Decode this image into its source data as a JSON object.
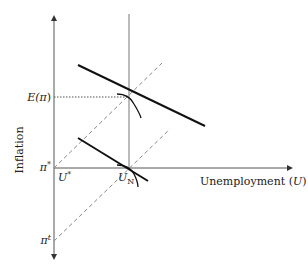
{
  "diagram": {
    "type": "phillips-curve-diagram",
    "axes": {
      "y_label": "Inflation",
      "x_label_text": "Unemployment (",
      "x_label_var": "U",
      "x_label_close": ")"
    },
    "labels": {
      "expected_inflation_base": "E(",
      "expected_inflation_var": "π",
      "expected_inflation_close": ")",
      "pi_star": "π*",
      "pi_star_base": "π",
      "pi_star_sup": "*",
      "u_star_base": "U",
      "u_star_sup": "*",
      "un_base": "U",
      "un_sub": "N",
      "pi_t_base": "π",
      "pi_t_sup": "t"
    },
    "colors": {
      "axis": "#555555",
      "solid_line": "#111111",
      "dashed_line": "#888888",
      "dotted_line": "#555555"
    }
  }
}
